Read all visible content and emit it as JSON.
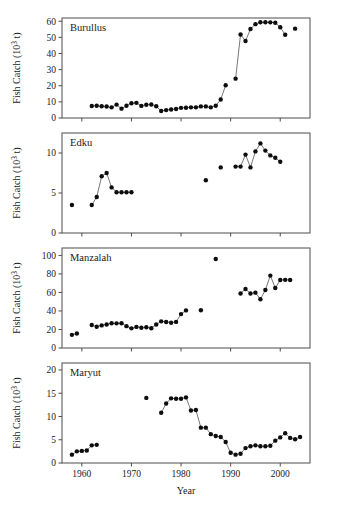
{
  "figure": {
    "x_axis_title": "Year",
    "y_axis_title": "Fish Catch (10³ t)",
    "x_ticks": [
      1960,
      1970,
      1980,
      1990,
      2000
    ],
    "x_range": [
      1956,
      2006
    ]
  },
  "chart_data": [
    {
      "type": "scatter",
      "title": "Burullus",
      "panel_label": "Burullus",
      "xlabel": "Year",
      "ylabel": "Fish Catch (10³ t)",
      "xlim": [
        1956,
        2006
      ],
      "ylim": [
        0,
        62
      ],
      "yticks": [
        0,
        10,
        20,
        30,
        40,
        50,
        60
      ],
      "xticks": [
        1960,
        1970,
        1980,
        1990,
        2000
      ],
      "grid": false,
      "legend": "none",
      "marker": "filled-circle",
      "connected": true,
      "x": [
        1962,
        1963,
        1964,
        1965,
        1966,
        1967,
        1968,
        1969,
        1970,
        1971,
        1972,
        1973,
        1974,
        1975,
        1976,
        1977,
        1978,
        1979,
        1980,
        1981,
        1982,
        1983,
        1984,
        1985,
        1986,
        1987,
        1988,
        1989,
        1991,
        1992,
        1993,
        1994,
        1995,
        1996,
        1997,
        1998,
        1999,
        2000,
        2001,
        2003
      ],
      "values": [
        7.4,
        7.6,
        7.3,
        7.1,
        6.6,
        8.3,
        5.8,
        7.6,
        9.1,
        9.4,
        7.5,
        8.2,
        8.4,
        7.3,
        4.3,
        4.9,
        5.3,
        5.6,
        6.3,
        6.4,
        6.6,
        6.6,
        7.2,
        7.2,
        6.6,
        7.6,
        11.5,
        20.3,
        24.4,
        51.8,
        47.7,
        55.2,
        58.2,
        59.4,
        59.4,
        59.3,
        59.1,
        56.3,
        51.6,
        55.4
      ]
    },
    {
      "type": "scatter",
      "title": "Edku",
      "panel_label": "Edku",
      "xlabel": "Year",
      "ylabel": "Fish Catch (10³ t)",
      "xlim": [
        1956,
        2006
      ],
      "ylim": [
        0,
        12.5
      ],
      "yticks": [
        0,
        5,
        10
      ],
      "xticks": [
        1960,
        1970,
        1980,
        1990,
        2000
      ],
      "grid": false,
      "legend": "none",
      "marker": "filled-circle",
      "connected": true,
      "x": [
        1958,
        1962,
        1963,
        1964,
        1965,
        1966,
        1967,
        1968,
        1969,
        1970,
        1985,
        1988,
        1991,
        1992,
        1993,
        1994,
        1995,
        1996,
        1997,
        1998,
        1999,
        2000
      ],
      "values": [
        3.5,
        3.5,
        4.5,
        7.1,
        7.5,
        5.7,
        5.1,
        5.1,
        5.1,
        5.1,
        6.6,
        8.2,
        8.3,
        8.3,
        9.8,
        8.2,
        10.2,
        11.2,
        10.3,
        9.7,
        9.4,
        8.9
      ]
    },
    {
      "type": "scatter",
      "title": "Manzalah",
      "panel_label": "Manzalah",
      "xlabel": "Year",
      "ylabel": "Fish Catch (10³ t)",
      "xlim": [
        1956,
        2006
      ],
      "ylim": [
        0,
        108
      ],
      "yticks": [
        0,
        20,
        40,
        60,
        80,
        100
      ],
      "xticks": [
        1960,
        1970,
        1980,
        1990,
        2000
      ],
      "grid": false,
      "legend": "none",
      "marker": "filled-circle",
      "connected": true,
      "x": [
        1958,
        1959,
        1962,
        1963,
        1964,
        1965,
        1966,
        1967,
        1968,
        1969,
        1970,
        1971,
        1972,
        1973,
        1974,
        1975,
        1976,
        1977,
        1978,
        1979,
        1980,
        1981,
        1984,
        1987,
        1992,
        1993,
        1994,
        1995,
        1996,
        1997,
        1998,
        1999,
        2000,
        2001,
        2002
      ],
      "values": [
        14.2,
        15.6,
        24.8,
        22.9,
        24.4,
        25.3,
        26.8,
        26.6,
        26.8,
        23.6,
        21.2,
        22.8,
        21.9,
        22.4,
        21.4,
        25.3,
        28.8,
        28.1,
        27.3,
        28.2,
        36.6,
        40.6,
        40.8,
        96.2,
        58.8,
        63.8,
        58.8,
        59.8,
        52.6,
        62.6,
        78.2,
        64.8,
        73.4,
        73.6,
        73.4
      ]
    },
    {
      "type": "scatter",
      "title": "Maryut",
      "panel_label": "Maryut",
      "xlabel": "Year",
      "ylabel": "Fish Catch (10³ t)",
      "xlim": [
        1956,
        2006
      ],
      "ylim": [
        0,
        21.5
      ],
      "yticks": [
        0,
        5,
        10,
        15,
        20
      ],
      "xticks": [
        1960,
        1970,
        1980,
        1990,
        2000
      ],
      "grid": false,
      "legend": "none",
      "marker": "filled-circle",
      "connected": true,
      "x": [
        1958,
        1959,
        1960,
        1961,
        1962,
        1963,
        1973,
        1976,
        1977,
        1978,
        1979,
        1980,
        1981,
        1982,
        1983,
        1984,
        1985,
        1986,
        1987,
        1988,
        1989,
        1990,
        1991,
        1992,
        1993,
        1994,
        1995,
        1996,
        1997,
        1998,
        1999,
        2000,
        2001,
        2002,
        2003,
        2004
      ],
      "values": [
        1.8,
        2.5,
        2.6,
        2.7,
        3.8,
        3.9,
        14.0,
        10.8,
        12.8,
        13.9,
        13.8,
        13.8,
        14.1,
        11.3,
        11.4,
        7.6,
        7.6,
        6.2,
        5.8,
        5.6,
        4.5,
        2.2,
        1.8,
        2.0,
        3.2,
        3.6,
        3.8,
        3.6,
        3.6,
        3.7,
        4.8,
        5.5,
        6.4,
        5.4,
        5.1,
        5.6
      ]
    }
  ]
}
